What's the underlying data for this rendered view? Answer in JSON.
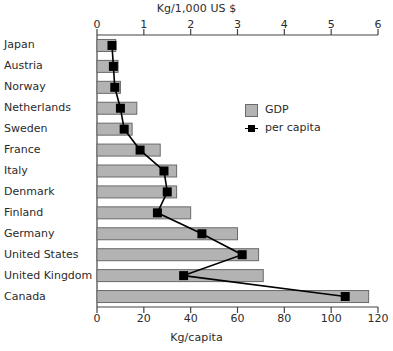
{
  "chart_data": {
    "type": "bar",
    "title": "",
    "top_axis": {
      "label": "Kg/1,000 US $",
      "ticks": [
        "0",
        "1",
        "2",
        "3",
        "4",
        "5",
        "6"
      ],
      "min": 0,
      "max": 6
    },
    "bottom_axis": {
      "label": "Kg/capita",
      "ticks": [
        "0",
        "20",
        "40",
        "60",
        "80",
        "100",
        "120"
      ],
      "min": 0,
      "max": 120
    },
    "categories": [
      "Japan",
      "Austria",
      "Norway",
      "Netherlands",
      "Sweden",
      "France",
      "Italy",
      "Denmark",
      "Finland",
      "Germany",
      "United States",
      "United Kingdom",
      "Canada"
    ],
    "series": [
      {
        "name": "GDP",
        "axis": "bottom",
        "unit": "Kg/capita",
        "color": "#b3b3b3",
        "values": [
          8,
          9,
          10,
          17,
          15,
          27,
          34,
          34,
          40,
          60,
          69,
          71,
          116
        ]
      },
      {
        "name": "per capita",
        "axis": "top",
        "unit": "Kg/1,000 US $",
        "color": "#000000",
        "values": [
          0.32,
          0.35,
          0.38,
          0.5,
          0.58,
          0.92,
          1.43,
          1.5,
          1.29,
          2.24,
          3.1,
          1.85,
          5.3
        ]
      }
    ],
    "grid": false,
    "legend_position": "upper-right"
  },
  "legend": {
    "entries": [
      {
        "label": "GDP"
      },
      {
        "label": "per capita"
      }
    ]
  }
}
